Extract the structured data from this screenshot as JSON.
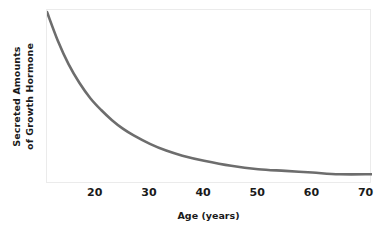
{
  "chart_data": {
    "type": "line",
    "title": "",
    "xlabel": "Age (years)",
    "ylabel_line1": "Secreted Amounts",
    "ylabel_line2": "of Growth Hormone",
    "xlim": [
      11,
      71
    ],
    "ylim": [
      0,
      100
    ],
    "grid": false,
    "legend": "none",
    "line_color": "#6d6d6d",
    "plot_border_color": "#ebebeb",
    "background_color": "#ffffff",
    "x_ticks": [
      20,
      30,
      40,
      50,
      60,
      70
    ],
    "x_tick_labels": [
      "20",
      "30",
      "40",
      "50",
      "60",
      "70"
    ],
    "y_ticks": [],
    "y_tick_labels": [],
    "series": [
      {
        "name": "Growth hormone secretion",
        "x": [
          11,
          13,
          15,
          17,
          19,
          21,
          23,
          25,
          27,
          30,
          33,
          36,
          40,
          45,
          50,
          55,
          60,
          65,
          71
        ],
        "y": [
          100,
          83,
          69,
          58,
          49,
          42,
          36,
          31,
          27,
          22,
          18,
          15,
          12,
          9,
          7,
          6,
          5,
          4,
          4
        ]
      }
    ],
    "annotation": "Growth hormone secretion declines sharply from the early teens and levels off after about age 50."
  },
  "axes": {
    "x_title": "Age (years)",
    "y_title_line_1": "Secreted Amounts",
    "y_title_line_2": "of Growth Hormone"
  }
}
